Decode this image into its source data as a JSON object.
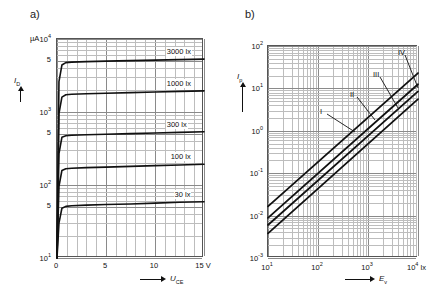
{
  "figure": {
    "panels": [
      {
        "label": "a)",
        "yaxis": {
          "unit": "µA",
          "title": "I_D",
          "title_main": "I",
          "title_sub": "D",
          "scale": "log",
          "ticks": [
            {
              "value": 10000,
              "text": "10",
              "exp": "4"
            },
            {
              "value": 5000,
              "text": "5",
              "exp": ""
            },
            {
              "value": 1000,
              "text": "10",
              "exp": "3"
            },
            {
              "value": 500,
              "text": "5",
              "exp": ""
            },
            {
              "value": 100,
              "text": "10",
              "exp": "2"
            },
            {
              "value": 50,
              "text": "5",
              "exp": ""
            },
            {
              "value": 10,
              "text": "10",
              "exp": "1"
            }
          ],
          "range": [
            10,
            10000
          ]
        },
        "xaxis": {
          "title_main": "U",
          "title_sub": "CE",
          "unit": "V",
          "scale": "linear",
          "ticks": [
            "0",
            "5",
            "10",
            "15"
          ],
          "range": [
            0,
            15
          ]
        },
        "curves": [
          {
            "label": "3000 lx",
            "saturation": 5200,
            "knee_current": 4700
          },
          {
            "label": "1000 lx",
            "saturation": 1900,
            "knee_current": 1700
          },
          {
            "label": "300 lx",
            "saturation": 520,
            "knee_current": 470
          },
          {
            "label": "100 lx",
            "saturation": 185,
            "knee_current": 165
          },
          {
            "label": "30 lx",
            "saturation": 57,
            "knee_current": 50
          }
        ]
      },
      {
        "label": "b)",
        "yaxis": {
          "title_main": "I",
          "title_sub": "p",
          "scale": "log",
          "ticks": [
            {
              "text": "10",
              "exp": "2"
            },
            {
              "text": "10",
              "exp": "1"
            },
            {
              "text": "10",
              "exp": "0"
            },
            {
              "text": "10",
              "exp": "-1"
            },
            {
              "text": "10",
              "exp": "-2"
            },
            {
              "text": "10",
              "exp": "-3"
            }
          ],
          "range": [
            0.001,
            100
          ]
        },
        "xaxis": {
          "title_main": "E",
          "title_sub": "v",
          "unit": "lx",
          "scale": "log",
          "ticks": [
            {
              "text": "10",
              "exp": "1"
            },
            {
              "text": "10",
              "exp": "2"
            },
            {
              "text": "10",
              "exp": "3"
            },
            {
              "text": "10",
              "exp": "4"
            }
          ],
          "range": [
            10,
            10000
          ]
        },
        "curves": [
          {
            "label": "I",
            "y_at_x1e1": 0.0165,
            "y_at_x1e4": 23.0
          },
          {
            "label": "II",
            "y_at_x1e1": 0.0088,
            "y_at_x1e4": 12.5
          },
          {
            "label": "III",
            "y_at_x1e1": 0.006,
            "y_at_x1e4": 8.5
          },
          {
            "label": "IV",
            "y_at_x1e1": 0.0038,
            "y_at_x1e4": 5.6
          }
        ]
      }
    ]
  },
  "chart_data": [
    {
      "type": "line",
      "title": "a)",
      "xlabel": "U_CE",
      "ylabel": "I_D",
      "xunit": "V",
      "yunit": "µA",
      "xscale": "linear",
      "yscale": "log",
      "xlim": [
        0,
        15
      ],
      "ylim": [
        10,
        10000
      ],
      "xticks": [
        0,
        5,
        10,
        15
      ],
      "yticks": [
        10,
        50,
        100,
        500,
        1000,
        5000,
        10000
      ],
      "ytick_labels": [
        "10^1",
        "5",
        "10^2",
        "5",
        "10^3",
        "5",
        "10^4"
      ],
      "grid": true,
      "legend": "inline-curve-labels",
      "series": [
        {
          "name": "3000 lx",
          "x": [
            0,
            0.2,
            0.5,
            0.9,
            1.5,
            3,
            5,
            7.5,
            10,
            12.5,
            15
          ],
          "values": [
            10,
            2600,
            4400,
            4750,
            4820,
            4900,
            4980,
            5060,
            5140,
            5220,
            5300
          ]
        },
        {
          "name": "1000 lx",
          "x": [
            0,
            0.2,
            0.5,
            0.9,
            1.5,
            3,
            5,
            7.5,
            10,
            12.5,
            15
          ],
          "values": [
            10,
            950,
            1600,
            1720,
            1750,
            1780,
            1810,
            1845,
            1880,
            1915,
            1950
          ]
        },
        {
          "name": "300 lx",
          "x": [
            0,
            0.2,
            0.5,
            0.9,
            1.5,
            3,
            5,
            7.5,
            10,
            12.5,
            15
          ],
          "values": [
            10,
            270,
            450,
            472,
            480,
            488,
            496,
            506,
            516,
            526,
            536
          ]
        },
        {
          "name": "100 lx",
          "x": [
            0,
            0.2,
            0.5,
            0.9,
            1.5,
            3,
            5,
            7.5,
            10,
            12.5,
            15
          ],
          "values": [
            10,
            96,
            158,
            167,
            170,
            173,
            176,
            180,
            184,
            188,
            192
          ]
        },
        {
          "name": "30 lx",
          "x": [
            0,
            0.2,
            0.5,
            0.9,
            1.5,
            3,
            5,
            7.5,
            10,
            12.5,
            15
          ],
          "values": [
            10,
            30,
            48,
            51,
            52,
            53,
            54,
            55,
            56.5,
            58,
            59
          ]
        }
      ]
    },
    {
      "type": "line",
      "title": "b)",
      "xlabel": "E_v",
      "ylabel": "I_p",
      "xunit": "lx",
      "xscale": "log",
      "yscale": "log",
      "xlim": [
        10,
        10000
      ],
      "ylim": [
        0.001,
        100
      ],
      "xticks": [
        10,
        100,
        1000,
        10000
      ],
      "xtick_labels": [
        "10^1",
        "10^2",
        "10^3",
        "10^4"
      ],
      "yticks": [
        0.001,
        0.01,
        0.1,
        1,
        10,
        100
      ],
      "ytick_labels": [
        "10^-3",
        "10^-2",
        "10^-1",
        "10^0",
        "10^1",
        "10^2"
      ],
      "grid": true,
      "legend": "inline-curve-labels",
      "series": [
        {
          "name": "I",
          "x": [
            10,
            10000
          ],
          "values": [
            0.0165,
            23.0
          ]
        },
        {
          "name": "II",
          "x": [
            10,
            10000
          ],
          "values": [
            0.0088,
            12.5
          ]
        },
        {
          "name": "III",
          "x": [
            10,
            10000
          ],
          "values": [
            0.006,
            8.5
          ]
        },
        {
          "name": "IV",
          "x": [
            10,
            10000
          ],
          "values": [
            0.0038,
            5.6
          ]
        }
      ]
    }
  ]
}
